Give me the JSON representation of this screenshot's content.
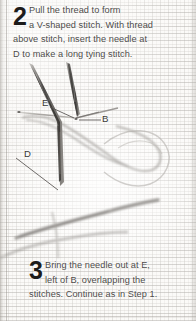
{
  "page": {
    "kind": "embroidery-instruction-diagram",
    "background_color": "#fbfaf8",
    "ink_color": "#4c4a48"
  },
  "steps": [
    {
      "number": "2",
      "lines": [
        "Pull the thread to form",
        "a V-shaped stitch. With thread",
        "above stitch, insert the needle at",
        "D to make a long tying stitch."
      ]
    },
    {
      "number": "3",
      "lines": [
        "Bring the needle out at E,",
        "left of B, overlapping the",
        "stitches. Continue as in Step 1."
      ]
    }
  ],
  "labels": [
    {
      "id": "E",
      "text": "E"
    },
    {
      "id": "B",
      "text": "B"
    },
    {
      "id": "D",
      "text": "D"
    }
  ],
  "illustration": {
    "description": "needle-and-thread-stitch-diagram",
    "needle_color": "#6a6865",
    "thread_color": "#8d8a86",
    "leader_line_color": "#55524f"
  }
}
